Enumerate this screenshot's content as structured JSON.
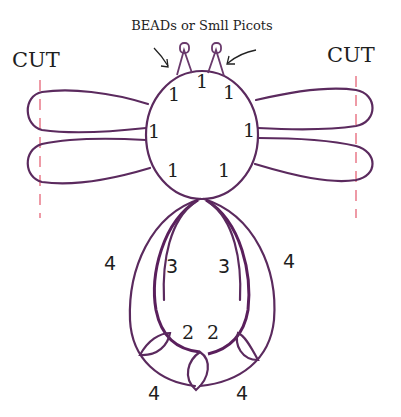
{
  "title": "BEADs or Smll Picots",
  "colors": {
    "thread": "#5b2a5e",
    "cut_line": "#ee9aa6",
    "text": "#1e1e1e",
    "background": "#ffffff"
  },
  "labels": {
    "cut_left": "CUT",
    "cut_right": "CUT"
  },
  "ring": {
    "stitch_counts": [
      "1",
      "1",
      "1",
      "1",
      "1",
      "1",
      "1"
    ]
  },
  "body": {
    "outer_chain_left": "4",
    "outer_chain_right": "4",
    "inner_chain_left": "3",
    "inner_chain_right": "3",
    "inner_bottom_left": "2",
    "inner_bottom_right": "2",
    "bottom_left": "4",
    "bottom_right": "4"
  }
}
